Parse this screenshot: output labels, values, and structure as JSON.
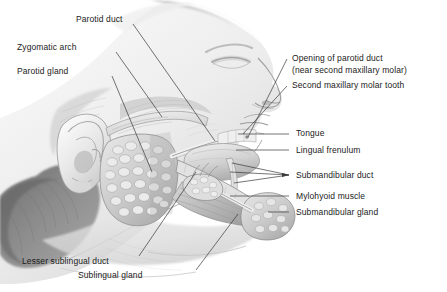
{
  "figure": {
    "type": "anatomical-illustration",
    "style": "grayscale pencil rendering",
    "background_color": "#ffffff",
    "ink_color": "#1b1b1b",
    "width": 447,
    "height": 292
  },
  "labels": {
    "parotid_duct": "Parotid duct",
    "zygomatic_arch": "Zygomatic arch",
    "parotid_gland": "Parotid gland",
    "opening_of_parotid_duct_line1": "Opening of parotid duct",
    "opening_of_parotid_duct_line2": "(near second maxillary molar)",
    "second_maxillary_molar_tooth": "Second maxillary molar tooth",
    "tongue": "Tongue",
    "lingual_frenulum": "Lingual frenulum",
    "submandibular_duct": "Submandibular duct",
    "mylohyoid_muscle": "Mylohyoid muscle",
    "submandibular_gland": "Submandibular gland",
    "lesser_sublingual_duct": "Lesser sublingual duct",
    "sublingual_gland": "Sublingual gland"
  }
}
